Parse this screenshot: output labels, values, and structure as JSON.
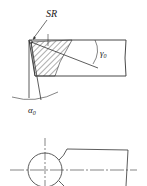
{
  "diagram": {
    "labels": {
      "sr": "SR",
      "gamma": "γ",
      "gamma_sub": "0",
      "alpha": "α",
      "alpha_sub": "0"
    },
    "colors": {
      "line": "#333333",
      "background": "#ffffff"
    }
  }
}
